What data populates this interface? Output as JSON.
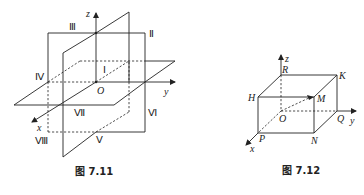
{
  "figures": [
    {
      "id": "fig-7-11",
      "caption": "图 7.11",
      "description": "Three coordinate planes dividing space into eight octants",
      "axes": {
        "x": "x",
        "y": "y",
        "z": "z",
        "origin": "O"
      },
      "octants": [
        "Ⅰ",
        "Ⅱ",
        "Ⅲ",
        "Ⅳ",
        "Ⅴ",
        "Ⅵ",
        "Ⅶ",
        "Ⅷ"
      ]
    },
    {
      "id": "fig-7-12",
      "caption": "图 7.12",
      "description": "Rectangular box with vertex M and its projections",
      "axes": {
        "x": "x",
        "y": "y",
        "z": "z",
        "origin": "O"
      },
      "vertices": {
        "R": "R",
        "K": "K",
        "H": "H",
        "M": "M",
        "P": "P",
        "Q": "Q",
        "N": "N",
        "O": "O"
      }
    }
  ]
}
